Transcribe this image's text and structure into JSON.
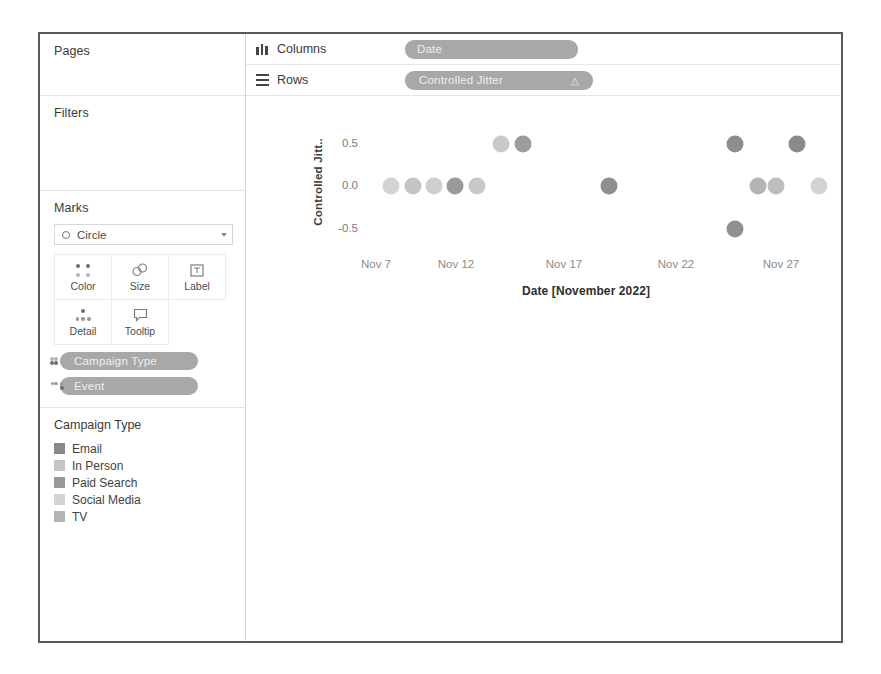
{
  "sidebar": {
    "pages": {
      "title": "Pages"
    },
    "filters": {
      "title": "Filters"
    },
    "marks": {
      "title": "Marks",
      "mark_type": "Circle",
      "properties": [
        {
          "name": "Color",
          "icon": "color-dots-icon"
        },
        {
          "name": "Size",
          "icon": "size-circles-icon"
        },
        {
          "name": "Label",
          "icon": "label-box-icon"
        },
        {
          "name": "Detail",
          "icon": "detail-dots-icon"
        },
        {
          "name": "Tooltip",
          "icon": "tooltip-bubble-icon"
        }
      ],
      "pills": [
        {
          "label": "Campaign Type",
          "icon": "color-dots-icon"
        },
        {
          "label": "Event",
          "icon": "detail-dots-icon"
        }
      ]
    },
    "legend": {
      "title": "Campaign Type",
      "items": [
        {
          "label": "Email",
          "color": "#8a8a8a"
        },
        {
          "label": "In Person",
          "color": "#c4c4c4"
        },
        {
          "label": "Paid Search",
          "color": "#989898"
        },
        {
          "label": "Social Media",
          "color": "#d3d3d3"
        },
        {
          "label": "TV",
          "color": "#b4b4b4"
        }
      ]
    }
  },
  "shelves": {
    "columns": {
      "label": "Columns",
      "pill": "Date"
    },
    "rows": {
      "label": "Rows",
      "pill": "Controlled Jitter",
      "sort_glyph": "△"
    }
  },
  "chart_data": {
    "type": "scatter",
    "title": "",
    "xlabel": "Date [November 2022]",
    "ylabel": "Controlled Jitt..",
    "ylabel_full": "Controlled Jitter",
    "ylim": [
      -0.75,
      0.75
    ],
    "yticks": [
      0.5,
      0.0,
      -0.5
    ],
    "ytick_labels": [
      "0.5",
      "0.0",
      "-0.5"
    ],
    "xticks": [
      "Nov 7",
      "Nov 12",
      "Nov 17",
      "Nov 22",
      "Nov 27"
    ],
    "xtick_px": [
      340,
      420,
      528,
      640,
      745
    ],
    "grid": false,
    "legend_position": "sidebar",
    "points": [
      {
        "x_px": 355,
        "y": 0.0,
        "color": "#d3d3d3",
        "campaign_type": "Social Media"
      },
      {
        "x_px": 377,
        "y": 0.0,
        "color": "#c4c4c4",
        "campaign_type": "In Person"
      },
      {
        "x_px": 398,
        "y": 0.0,
        "color": "#cecece",
        "campaign_type": "Social Media"
      },
      {
        "x_px": 419,
        "y": 0.0,
        "color": "#9a9a9a",
        "campaign_type": "Paid Search"
      },
      {
        "x_px": 441,
        "y": 0.0,
        "color": "#c8c8c8",
        "campaign_type": "In Person"
      },
      {
        "x_px": 465,
        "y": 0.5,
        "color": "#c9c9c9",
        "campaign_type": "In Person"
      },
      {
        "x_px": 487,
        "y": 0.5,
        "color": "#9c9c9c",
        "campaign_type": "Paid Search"
      },
      {
        "x_px": 573,
        "y": 0.0,
        "color": "#8f8f8f",
        "campaign_type": "Email"
      },
      {
        "x_px": 699,
        "y": 0.5,
        "color": "#8d8d8d",
        "campaign_type": "Email"
      },
      {
        "x_px": 761,
        "y": 0.5,
        "color": "#8a8a8a",
        "campaign_type": "Email"
      },
      {
        "x_px": 722,
        "y": 0.0,
        "color": "#b4b4b4",
        "campaign_type": "TV"
      },
      {
        "x_px": 740,
        "y": 0.0,
        "color": "#bdbdbd",
        "campaign_type": "TV"
      },
      {
        "x_px": 783,
        "y": 0.0,
        "color": "#d2d2d2",
        "campaign_type": "Social Media"
      },
      {
        "x_px": 699,
        "y": -0.5,
        "color": "#909090",
        "campaign_type": "Email"
      }
    ]
  }
}
